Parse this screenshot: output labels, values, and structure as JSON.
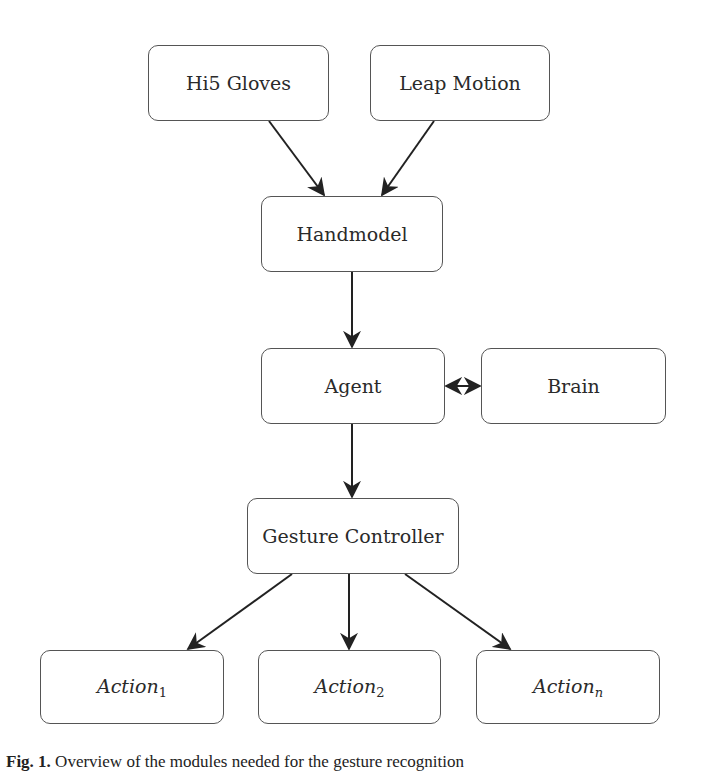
{
  "diagram": {
    "nodes": [
      {
        "id": "hi5",
        "label": "Hi5 Gloves"
      },
      {
        "id": "leap",
        "label": "Leap Motion"
      },
      {
        "id": "handmodel",
        "label": "Handmodel"
      },
      {
        "id": "agent",
        "label": "Agent"
      },
      {
        "id": "brain",
        "label": "Brain"
      },
      {
        "id": "gesture",
        "label": "Gesture Controller"
      },
      {
        "id": "action1",
        "label": "Action",
        "subscript": "1"
      },
      {
        "id": "action2",
        "label": "Action",
        "subscript": "2"
      },
      {
        "id": "actionn",
        "label": "Action",
        "subscript": "n"
      }
    ],
    "edges": [
      {
        "from": "hi5",
        "to": "handmodel",
        "type": "directed"
      },
      {
        "from": "leap",
        "to": "handmodel",
        "type": "directed"
      },
      {
        "from": "handmodel",
        "to": "agent",
        "type": "directed"
      },
      {
        "from": "agent",
        "to": "brain",
        "type": "bidirectional"
      },
      {
        "from": "agent",
        "to": "gesture",
        "type": "directed"
      },
      {
        "from": "gesture",
        "to": "action1",
        "type": "directed"
      },
      {
        "from": "gesture",
        "to": "action2",
        "type": "directed"
      },
      {
        "from": "gesture",
        "to": "actionn",
        "type": "directed"
      }
    ]
  },
  "caption": {
    "prefix": "Fig. 1.",
    "text": "Overview of the modules needed for the gesture recognition"
  },
  "colors": {
    "stroke": "#555555",
    "arrow": "#222222",
    "background": "#ffffff"
  }
}
